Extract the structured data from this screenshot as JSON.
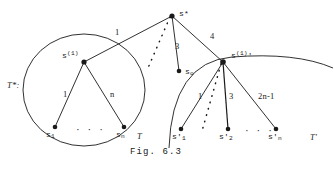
{
  "figure": {
    "caption": "Fig. 6.3",
    "tree_star_label": "T*:",
    "left_tree_label": "T",
    "right_tree_label": "T'",
    "nodes": {
      "root": {
        "name": "s*",
        "x": 172,
        "y": 16
      },
      "left_child": {
        "name": "s",
        "sup": "(1)",
        "x": 84,
        "y": 62
      },
      "middle_child": {
        "name": "s",
        "sub": "o",
        "x": 179,
        "y": 71
      },
      "right_child": {
        "name": "s",
        "sup": "(1)",
        "prime": "'",
        "x": 223,
        "y": 62
      },
      "left_leaf_first": {
        "name": "s",
        "sub": "1",
        "x": 55,
        "y": 127
      },
      "left_leaf_last": {
        "name": "s",
        "sub": "n",
        "x": 124,
        "y": 127
      },
      "right_leaf_first": {
        "name": "s",
        "prime": "'",
        "sub": "1",
        "x": 181,
        "y": 129
      },
      "right_leaf_second": {
        "name": "s",
        "prime": "'",
        "sub": "2",
        "x": 228,
        "y": 129
      },
      "right_leaf_last": {
        "name": "s",
        "prime": "'",
        "sub": "n",
        "x": 276,
        "y": 129
      }
    },
    "edge_labels": {
      "root_to_left": "1",
      "root_to_middle": "3",
      "root_to_right": "4",
      "left_first": "1",
      "left_last": "n",
      "right_first": "1",
      "right_second": "3",
      "right_last": "2n-1"
    },
    "ellipsis": "·  ·  ·",
    "colors": {
      "stroke": "#1a1a1a",
      "text": "#1a1a1a",
      "background": "#ffffff"
    }
  }
}
